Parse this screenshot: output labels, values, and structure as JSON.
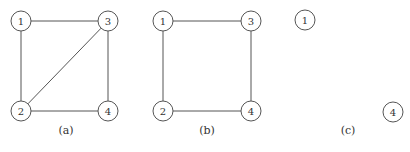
{
  "figures": [
    {
      "caption": "(a)",
      "caption_pos": [
        66,
        130
      ],
      "nodes": [
        {
          "id": "1",
          "label": "1",
          "x": 21,
          "y": 21
        },
        {
          "id": "3",
          "label": "3",
          "x": 108,
          "y": 21
        },
        {
          "id": "2",
          "label": "2",
          "x": 21,
          "y": 111
        },
        {
          "id": "4",
          "label": "4",
          "x": 108,
          "y": 111
        }
      ],
      "edges": [
        [
          "1",
          "3"
        ],
        [
          "1",
          "2"
        ],
        [
          "3",
          "4"
        ],
        [
          "2",
          "4"
        ],
        [
          "2",
          "3"
        ]
      ]
    },
    {
      "caption": "(b)",
      "caption_pos": [
        207,
        130
      ],
      "nodes": [
        {
          "id": "1",
          "label": "1",
          "x": 163,
          "y": 21
        },
        {
          "id": "3",
          "label": "3",
          "x": 251,
          "y": 21
        },
        {
          "id": "2",
          "label": "2",
          "x": 163,
          "y": 111
        },
        {
          "id": "4",
          "label": "4",
          "x": 251,
          "y": 111
        }
      ],
      "edges": [
        [
          "1",
          "3"
        ],
        [
          "1",
          "2"
        ],
        [
          "3",
          "4"
        ],
        [
          "2",
          "4"
        ]
      ]
    },
    {
      "caption": "(c)",
      "caption_pos": [
        348,
        130
      ],
      "nodes": [
        {
          "id": "1",
          "label": "1",
          "x": 305,
          "y": 20
        },
        {
          "id": "4",
          "label": "4",
          "x": 393,
          "y": 112
        }
      ],
      "edges": []
    }
  ],
  "node_radius": 10,
  "colors": {
    "stroke": "#555555",
    "text": "#333333",
    "background": "#ffffff"
  }
}
